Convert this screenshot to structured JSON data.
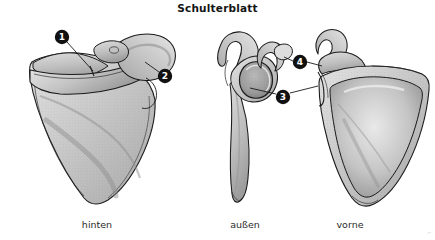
{
  "figure": {
    "title": "Schulterblatt",
    "background_color": "#ffffff",
    "ink_color": "#1b1b1b",
    "bone_fill_light": "#d9d9d9",
    "bone_fill_mid": "#bdbdbd",
    "bone_fill_dark": "#9a9a9a",
    "marker_fill": "#111111",
    "marker_text_color": "#ffffff"
  },
  "views": [
    {
      "id": "posterior",
      "label": "hinten"
    },
    {
      "id": "lateral",
      "label": "außen"
    },
    {
      "id": "anterior",
      "label": "vorne"
    }
  ],
  "markers": [
    {
      "id": "marker-1",
      "number": "1",
      "view": "posterior",
      "cx": 62,
      "cy": 37
    },
    {
      "id": "marker-2",
      "number": "2",
      "view": "posterior",
      "cx": 165,
      "cy": 76
    },
    {
      "id": "marker-3",
      "number": "3",
      "view": "lateral",
      "cx": 283,
      "cy": 97
    },
    {
      "id": "marker-4",
      "number": "4",
      "view": "lateral",
      "cx": 300,
      "cy": 62
    }
  ],
  "corner_mark": "⌐"
}
